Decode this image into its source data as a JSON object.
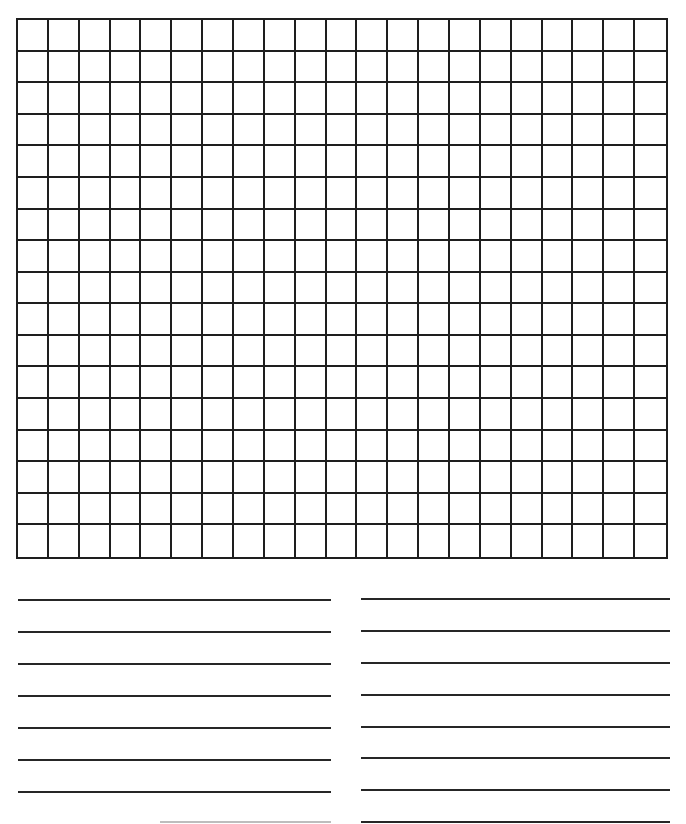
{
  "worksheet": {
    "type": "blank graph paper with writing lines",
    "grid": {
      "columns": 21,
      "rows": 17,
      "line_color": "#1e1e1e"
    },
    "writing_lines": {
      "left": {
        "count": 7,
        "y_positions": [
          600,
          632,
          664,
          696,
          728,
          760,
          792
        ],
        "partial_line": {
          "y": 822,
          "x_start": 160,
          "x_end": 331
        }
      },
      "right": {
        "count": 8,
        "y_positions": [
          599,
          631,
          663,
          695,
          727,
          758,
          790,
          822
        ]
      },
      "line_color": "#262626"
    }
  }
}
